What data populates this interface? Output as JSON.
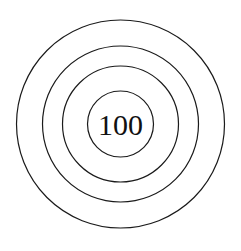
{
  "diagram": {
    "type": "concentric-circles",
    "ring_count": 4,
    "center_label": "100",
    "stroke_color": "#1a1a1a",
    "background_color": "#ffffff"
  }
}
